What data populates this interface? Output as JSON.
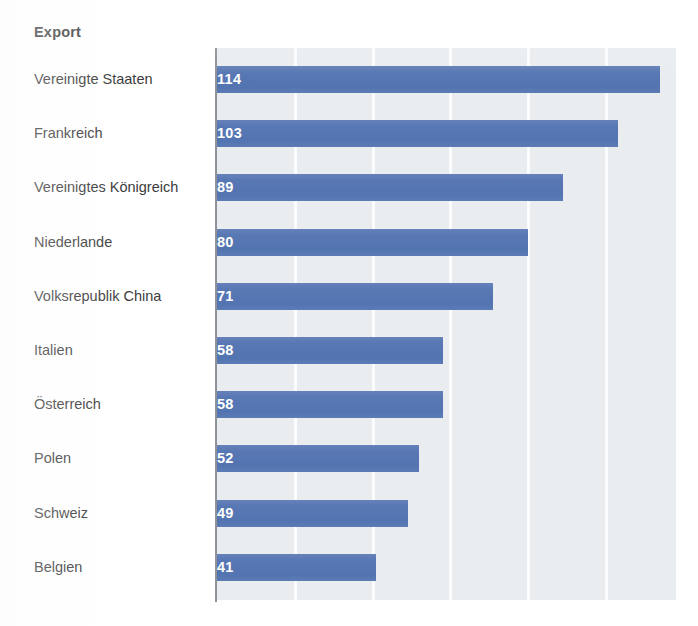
{
  "chart_data": {
    "type": "bar",
    "orientation": "horizontal",
    "title": "Export",
    "xlabel": "",
    "ylabel": "",
    "categories": [
      "Vereinigte Staaten",
      "Frankreich",
      "Vereinigtes Königreich",
      "Niederlande",
      "Volksrepublik China",
      "Italien",
      "Österreich",
      "Polen",
      "Schweiz",
      "Belgien"
    ],
    "values": [
      114,
      103,
      89,
      80,
      71,
      58,
      58,
      52,
      49,
      41
    ],
    "value_labels": [
      "114",
      "103",
      "89",
      "80",
      "71",
      "58",
      "58",
      "52",
      "49",
      "41"
    ],
    "xlim": [
      0,
      118
    ],
    "gridlines": [
      20,
      40,
      60,
      80,
      100
    ],
    "grid": true,
    "legend": null,
    "colors": {
      "bar": "#5878b4",
      "plot_background": "#e9edf0",
      "gridline": "#fbfcfd",
      "axis_line": "#8d9298",
      "value_label_text": "#ffffff",
      "category_label_text": "#3c3c3c",
      "title_text": "#262626",
      "page_background": "#ffffff"
    }
  }
}
